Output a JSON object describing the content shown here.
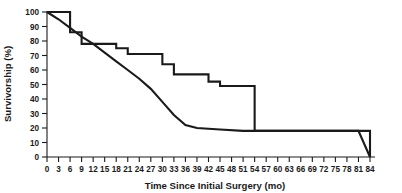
{
  "chart_data": {
    "type": "line",
    "title": "",
    "xlabel": "Time Since Initial Surgery (mo)",
    "ylabel": "Survivorship (%)",
    "xlim": [
      0,
      84
    ],
    "ylim": [
      0,
      100
    ],
    "grid": false,
    "legend_position": "none",
    "x_ticks": [
      0,
      3,
      6,
      9,
      12,
      15,
      18,
      21,
      24,
      27,
      30,
      33,
      36,
      39,
      42,
      45,
      48,
      51,
      54,
      57,
      60,
      63,
      66,
      69,
      72,
      75,
      78,
      81,
      84
    ],
    "x_tick_labels": [
      "0",
      "3",
      "6",
      "9",
      "12",
      "15",
      "18",
      "21",
      "24",
      "27",
      "30",
      "33",
      "36",
      "39",
      "42",
      "45",
      "48",
      "51",
      "54",
      "57",
      "60",
      "63",
      "66",
      "69",
      "72",
      "75",
      "78",
      "81",
      "84"
    ],
    "y_ticks": [
      0,
      10,
      20,
      30,
      40,
      50,
      60,
      70,
      80,
      90,
      100
    ],
    "y_tick_labels": [
      "0",
      "10",
      "20",
      "30",
      "40",
      "50",
      "60",
      "70",
      "80",
      "90",
      "100"
    ],
    "line_color": "#1a1a1a",
    "series": [
      {
        "name": "upper-stepped-curve",
        "style": "step",
        "x": [
          0,
          6,
          9,
          15,
          18,
          21,
          27,
          30,
          33,
          39,
          42,
          45,
          51,
          54,
          81,
          84
        ],
        "values": [
          100,
          86,
          78,
          78,
          75,
          71,
          71,
          64,
          57,
          57,
          52,
          49,
          49,
          18,
          18,
          0
        ]
      },
      {
        "name": "lower-smooth-curve",
        "style": "line",
        "x": [
          0,
          3,
          6,
          9,
          12,
          15,
          18,
          21,
          24,
          27,
          30,
          33,
          36,
          39,
          45,
          51,
          81,
          84
        ],
        "values": [
          100,
          95,
          89,
          83,
          78,
          72,
          66,
          60,
          54,
          47,
          38,
          29,
          22,
          20,
          19,
          18,
          18,
          0
        ]
      }
    ]
  },
  "axes": {
    "x_title": "Time Since Initial Surgery (mo)",
    "y_title": "Survivorship (%)"
  }
}
